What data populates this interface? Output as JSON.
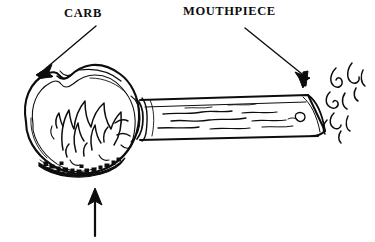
{
  "figure": {
    "background_color": "#ffffff",
    "ink_color": "#0d0d0d",
    "labels": [
      {
        "id": "carb",
        "text": "CARB",
        "x": 64,
        "y": 6
      },
      {
        "id": "mouthpiece",
        "text": "MOUTHPIECE",
        "x": 183,
        "y": 4
      }
    ],
    "annotations": {
      "carb_arrow": {
        "name": "carb-arrow",
        "description": "arrow pointing down-left from CARB label to the carb notch on the bowl",
        "from": [
          95,
          26
        ],
        "to": [
          40,
          72
        ]
      },
      "mouthpiece_arrow": {
        "name": "mouthpiece-arrow",
        "description": "arrow pointing down-right from MOUTHPIECE label to the end of the stem",
        "from": [
          244,
          28
        ],
        "to": [
          305,
          78
        ]
      },
      "bottom_arrow": {
        "name": "bottom-arrow",
        "description": "unlabeled arrow pointing up at the underside of the bowl",
        "from": [
          95,
          235
        ],
        "to": [
          95,
          190
        ]
      }
    },
    "parts": {
      "bowl": "round bowl at left containing drawn flames and granular material",
      "carb_notch": "small notch/hole at the upper-left rim of the bowl",
      "stem": "long tapered flat stem extending to the right",
      "mouthpiece": "open end of the stem at the far right",
      "flames": "flame strokes drawn inside the bowl",
      "material": "dark granular material along the bowl floor",
      "smoke": "smoke wisps curling up to the right of the mouthpiece"
    }
  }
}
